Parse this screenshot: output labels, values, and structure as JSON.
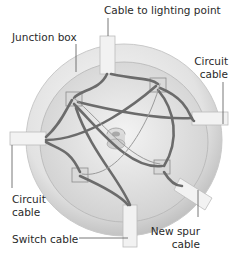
{
  "diagram": {
    "labels": {
      "cable_to_lighting_point": "Cable to lighting point",
      "junction_box": "Junction box",
      "circuit_cable_right_1": "Circuit",
      "circuit_cable_right_2": "cable",
      "circuit_cable_left_1": "Circuit",
      "circuit_cable_left_2": "cable",
      "switch_cable": "Switch cable",
      "new_spur_cable_1": "New spur",
      "new_spur_cable_2": "cable"
    },
    "colors": {
      "box_fill": "#efefef",
      "box_shadow": "#bdbdbd",
      "wire": "#6b6b6b",
      "text": "#2a2a2a",
      "leader": "#555555"
    }
  }
}
